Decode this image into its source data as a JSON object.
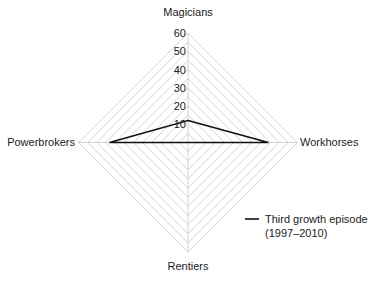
{
  "chart_data": {
    "type": "radar",
    "title": "",
    "axes": [
      "Magicians",
      "Workhorses",
      "Rentiers",
      "Powerbrokers"
    ],
    "ticks": [
      "10",
      "20",
      "30",
      "40",
      "50",
      "60"
    ],
    "range": [
      0,
      60
    ],
    "grid": true,
    "series": [
      {
        "name": "Third growth episode (1997–2010)",
        "values": [
          12,
          44,
          0,
          43
        ],
        "color": "#111111"
      }
    ],
    "legend": {
      "line1": "Third growth episode",
      "line2": "(1997–2010)",
      "position": "bottom-right"
    }
  }
}
